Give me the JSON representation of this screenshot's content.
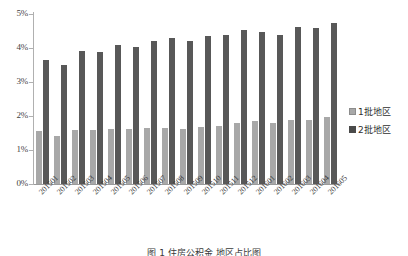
{
  "chart_data": {
    "type": "bar",
    "title": "",
    "xlabel": "",
    "ylabel": "",
    "ylim": [
      0,
      5
    ],
    "ytick_labels": [
      "0%",
      "1%",
      "2%",
      "3%",
      "4%",
      "5%"
    ],
    "ytick_values": [
      0,
      1,
      2,
      3,
      4,
      5
    ],
    "grid": false,
    "legend_position": "right",
    "categories": [
      "201501",
      "201502",
      "201503",
      "201504",
      "201505",
      "201506",
      "201507",
      "201508",
      "201509",
      "201510",
      "201511",
      "201512",
      "201601",
      "201602",
      "201603",
      "201604",
      "201605"
    ],
    "series": [
      {
        "name": "1批地区",
        "color": "#a8a8a8",
        "values": [
          1.55,
          1.42,
          1.6,
          1.58,
          1.63,
          1.62,
          1.66,
          1.66,
          1.63,
          1.69,
          1.72,
          1.8,
          1.84,
          1.78,
          1.88,
          1.88,
          1.96
        ]
      },
      {
        "name": "2批地区",
        "color": "#585858",
        "values": [
          3.66,
          3.51,
          3.92,
          3.88,
          4.08,
          4.04,
          4.22,
          4.28,
          4.21,
          4.35,
          4.38,
          4.52,
          4.48,
          4.38,
          4.62,
          4.6,
          4.73
        ]
      }
    ]
  },
  "legend": {
    "items": [
      {
        "label": "1批地区",
        "swatch": "light-gray-swatch"
      },
      {
        "label": "2批地区",
        "swatch": "dark-gray-swatch"
      }
    ]
  },
  "caption": {
    "text": "图 1 住房公积金 地区占比图"
  }
}
